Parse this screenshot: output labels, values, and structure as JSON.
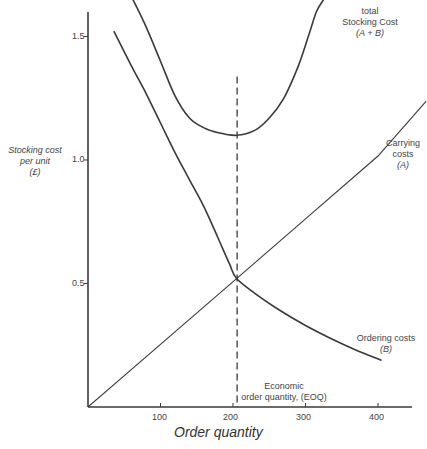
{
  "chart_data": {
    "type": "line",
    "title": "",
    "xlabel": "Order quantity",
    "ylabel": "Stocking cost per unit (£)",
    "ylabel_lines": [
      "Stocking cost",
      "per unit",
      "(£)"
    ],
    "xlim": [
      0,
      460
    ],
    "ylim": [
      0,
      1.6
    ],
    "x_ticks": [
      100,
      200,
      300,
      400
    ],
    "x_tick_labels": [
      "100",
      "200",
      "300",
      "400"
    ],
    "y_ticks": [
      0.5,
      1.0,
      1.5
    ],
    "y_tick_labels": [
      "0.5",
      "1.0",
      "1.5"
    ],
    "grid": false,
    "legend": "inline labels",
    "series": [
      {
        "name": "Carrying costs (A)",
        "label_lines": [
          "Carrying",
          "costs",
          "(A)"
        ],
        "style": "solid-thin",
        "x": [
          0,
          100,
          205,
          300,
          400,
          466
        ],
        "y": [
          0,
          0.254,
          0.52,
          0.762,
          1.016,
          1.236
        ]
      },
      {
        "name": "Ordering costs (B)",
        "label_lines": [
          "Ordering costs",
          "(B)"
        ],
        "style": "solid",
        "x": [
          36,
          60,
          80,
          100,
          120,
          140,
          160,
          180,
          195,
          205,
          230,
          260,
          300,
          340,
          370,
          404
        ],
        "y": [
          1.52,
          1.38,
          1.27,
          1.15,
          1.03,
          0.92,
          0.81,
          0.68,
          0.58,
          0.52,
          0.46,
          0.4,
          0.33,
          0.27,
          0.23,
          0.19
        ]
      },
      {
        "name": "total Stocking Cost (A + B)",
        "label_lines": [
          "total",
          "Stocking Cost",
          "(A + B)"
        ],
        "style": "solid",
        "x": [
          62,
          80,
          100,
          120,
          140,
          160,
          180,
          205,
          230,
          250,
          270,
          290,
          305,
          315,
          325
        ],
        "y": [
          1.65,
          1.54,
          1.4,
          1.26,
          1.17,
          1.13,
          1.11,
          1.1,
          1.12,
          1.17,
          1.25,
          1.38,
          1.51,
          1.6,
          1.65
        ]
      }
    ],
    "annotations": [
      {
        "type": "vertical-dashed-line",
        "x": 205,
        "y_from": 0,
        "y_to": 1.35,
        "label_lines": [
          "Economic",
          "order quantity, (EOQ)"
        ]
      }
    ]
  },
  "labels": {
    "total_line1": "total",
    "total_line2": "Stocking Cost",
    "total_line3": "(A + B)",
    "carrying_line1": "Carrying",
    "carrying_line2": "costs",
    "carrying_line3": "(A)",
    "ordering_line1": "Ordering costs",
    "ordering_line2": "(B)",
    "eoq_line1": "Economic",
    "eoq_line2": "order quantity, (EOQ)",
    "ylabel_line1": "Stocking cost",
    "ylabel_line2": "per unit",
    "ylabel_line3": "(£)",
    "xlabel": "Order quantity",
    "ytick_15": "1.5",
    "ytick_10": "1.0",
    "ytick_05": "0.5",
    "xtick_100": "100",
    "xtick_200": "200",
    "xtick_300": "300",
    "xtick_400": "400"
  },
  "colors": {
    "ink": "#3a3a3a",
    "background": "#ffffff"
  }
}
